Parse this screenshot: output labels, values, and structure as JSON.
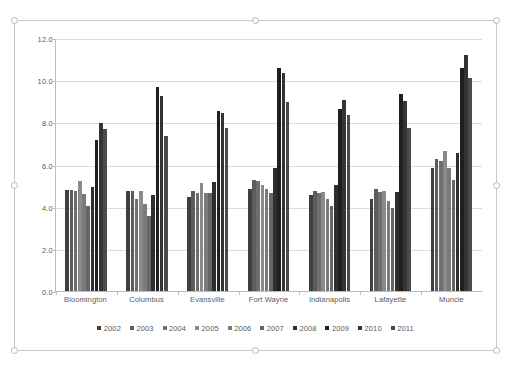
{
  "chart_data": {
    "type": "bar",
    "title": "",
    "subtitle": "",
    "xlabel": "",
    "ylabel": "",
    "ylim": [
      0,
      12
    ],
    "yticks": [
      "0.0",
      "2.0",
      "4.0",
      "6.0",
      "8.0",
      "10.0",
      "12.0"
    ],
    "ytick_values": [
      0,
      2,
      4,
      6,
      8,
      10,
      12
    ],
    "grid": true,
    "legend_position": "bottom",
    "categories": [
      "Bloomington",
      "Columbus",
      "Evansville",
      "Fort Wayne",
      "Indianapolis",
      "Lafayette",
      "Muncie"
    ],
    "series": [
      {
        "name": "2002",
        "color": "#3f3f3f",
        "values": [
          4.8,
          4.75,
          4.45,
          4.85,
          4.55,
          4.35,
          5.85
        ]
      },
      {
        "name": "2003",
        "color": "#5c5c5c",
        "values": [
          4.8,
          4.75,
          4.75,
          5.25,
          4.75,
          4.85,
          6.25
        ]
      },
      {
        "name": "2004",
        "color": "#6e6e6e",
        "values": [
          4.75,
          4.35,
          4.65,
          5.2,
          4.65,
          4.7,
          6.15
        ]
      },
      {
        "name": "2005",
        "color": "#8a8a8a",
        "values": [
          5.2,
          4.75,
          5.1,
          5.05,
          4.7,
          4.75,
          6.65
        ]
      },
      {
        "name": "2006",
        "color": "#7a7a7a",
        "values": [
          4.6,
          4.15,
          4.65,
          4.85,
          4.35,
          4.25,
          5.85
        ]
      },
      {
        "name": "2007",
        "color": "#666666",
        "values": [
          4.05,
          3.55,
          4.65,
          4.65,
          4.05,
          3.95,
          5.25
        ]
      },
      {
        "name": "2008",
        "color": "#2e2e2e",
        "values": [
          4.95,
          4.55,
          5.15,
          5.85,
          5.05,
          4.7,
          6.55
        ]
      },
      {
        "name": "2009",
        "color": "#1f1f1f",
        "values": [
          7.15,
          9.7,
          8.55,
          10.6,
          8.65,
          9.35,
          10.6
        ]
      },
      {
        "name": "2010",
        "color": "#343434",
        "values": [
          7.95,
          9.25,
          8.45,
          10.35,
          9.05,
          9.0,
          11.2
        ]
      },
      {
        "name": "2011",
        "color": "#4a4a4a",
        "values": [
          7.7,
          7.35,
          7.75,
          8.95,
          8.35,
          7.75,
          10.1
        ]
      }
    ]
  },
  "selection": {
    "handle_names": [
      "top-left",
      "top-center",
      "top-right",
      "middle-left",
      "middle-right",
      "bottom-left",
      "bottom-center",
      "bottom-right"
    ]
  }
}
